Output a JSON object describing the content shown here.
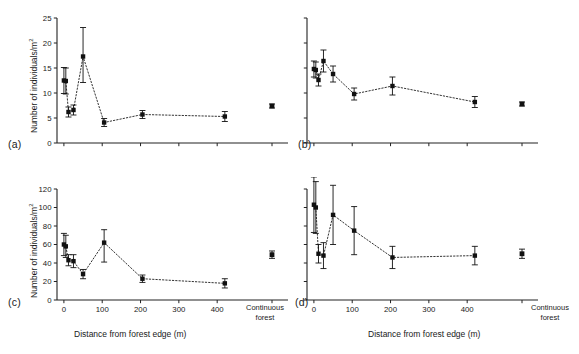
{
  "figure": {
    "panels": [
      "a",
      "b",
      "c",
      "d"
    ],
    "tag_a": "(a)",
    "tag_b": "(b)",
    "tag_c": "(c)",
    "tag_d": "(d)",
    "ylabel_text": "Number of individuals/m",
    "ylabel_sup": "2",
    "xlabel_text": "Distance from forest edge (m)",
    "continuous_label_line1": "Continuous",
    "continuous_label_line2": "forest",
    "marker_color": "#111111",
    "line_color": "#333333",
    "axis_color": "#222222"
  },
  "chart_data": [
    {
      "type": "scatter",
      "panel": "a",
      "title": "(a)",
      "xlabel": "",
      "ylabel": "Number of individuals/m2",
      "xlim": [
        -18,
        470
      ],
      "ylim": [
        0,
        25
      ],
      "yticks": [
        0,
        5,
        10,
        15,
        20,
        25
      ],
      "ytick_labels": [
        "0",
        "5",
        "10",
        "15",
        "20",
        "25"
      ],
      "xticks": [
        0,
        100,
        200,
        300,
        400
      ],
      "xtick_labels": [
        "",
        "",
        "",
        "",
        ""
      ],
      "grid": false,
      "legend": "none",
      "x": [
        0,
        5,
        12,
        25,
        50,
        105,
        205,
        420
      ],
      "y": [
        12.5,
        12.4,
        6.2,
        6.6,
        17.3,
        4.1,
        5.7,
        5.3
      ],
      "yerr_low": [
        2.6,
        2.6,
        1.0,
        1.0,
        5.2,
        0.8,
        0.8,
        1.0
      ],
      "yerr_high": [
        2.6,
        2.6,
        1.0,
        1.0,
        5.8,
        0.8,
        0.8,
        1.0
      ],
      "continuous_forest": {
        "value": 7.4,
        "err_low": 0.4,
        "err_high": 0.4
      },
      "connect_dotted": true
    },
    {
      "type": "scatter",
      "panel": "b",
      "title": "(b)",
      "xlabel": "",
      "ylabel": "",
      "xlim": [
        -18,
        470
      ],
      "ylim": [
        0,
        25
      ],
      "yticks": [
        0,
        5,
        10,
        15,
        20,
        25
      ],
      "ytick_labels": [
        "",
        "",
        "",
        "",
        "",
        ""
      ],
      "xticks": [
        0,
        100,
        200,
        300,
        400
      ],
      "xtick_labels": [
        "",
        "",
        "",
        "",
        ""
      ],
      "grid": false,
      "legend": "none",
      "x": [
        0,
        5,
        12,
        25,
        50,
        105,
        205,
        420
      ],
      "y": [
        14.8,
        14.6,
        12.6,
        16.4,
        13.8,
        9.8,
        11.4,
        8.2
      ],
      "yerr_low": [
        1.6,
        1.6,
        1.2,
        2.2,
        1.6,
        1.2,
        1.8,
        1.1
      ],
      "yerr_high": [
        1.6,
        1.6,
        1.2,
        2.2,
        1.6,
        1.2,
        1.8,
        1.1
      ],
      "continuous_forest": {
        "value": 7.8,
        "err_low": 0.4,
        "err_high": 0.4
      },
      "connect_dotted": true
    },
    {
      "type": "scatter",
      "panel": "c",
      "title": "(c)",
      "xlabel": "Distance from forest edge (m)",
      "ylabel": "Number of individuals/m2",
      "xlim": [
        -18,
        470
      ],
      "ylim": [
        0,
        120
      ],
      "yticks": [
        0,
        20,
        40,
        60,
        80,
        100,
        120
      ],
      "ytick_labels": [
        "0",
        "20",
        "40",
        "60",
        "80",
        "100",
        "120"
      ],
      "xticks": [
        0,
        100,
        200,
        300,
        400
      ],
      "xtick_labels": [
        "0",
        "100",
        "200",
        "300",
        "400"
      ],
      "grid": false,
      "legend": "none",
      "x": [
        0,
        5,
        12,
        25,
        50,
        105,
        205,
        420
      ],
      "y": [
        60,
        58,
        43,
        42,
        28,
        62,
        23,
        18
      ],
      "yerr_low": [
        12,
        12,
        6,
        7,
        5,
        21,
        4,
        5
      ],
      "yerr_high": [
        12,
        12,
        6,
        7,
        5,
        14,
        4,
        5
      ],
      "continuous_forest": {
        "value": 49,
        "err_low": 4,
        "err_high": 4
      },
      "connect_dotted": true
    },
    {
      "type": "scatter",
      "panel": "d",
      "title": "(d)",
      "xlabel": "Distance from forest edge (m)",
      "ylabel": "",
      "xlim": [
        -18,
        470
      ],
      "ylim": [
        0,
        120
      ],
      "yticks": [
        0,
        20,
        40,
        60,
        80,
        100,
        120
      ],
      "ytick_labels": [
        "",
        "",
        "",
        "",
        "",
        "",
        ""
      ],
      "xticks": [
        0,
        100,
        200,
        300,
        400
      ],
      "xtick_labels": [
        "0",
        "100",
        "200",
        "300",
        "400"
      ],
      "grid": false,
      "legend": "none",
      "x": [
        0,
        5,
        12,
        25,
        50,
        105,
        205,
        420
      ],
      "y": [
        103,
        100,
        50,
        48,
        92,
        75,
        46,
        48
      ],
      "yerr_low": [
        30,
        28,
        10,
        14,
        32,
        26,
        12,
        10
      ],
      "yerr_high": [
        30,
        28,
        10,
        14,
        32,
        26,
        12,
        10
      ],
      "continuous_forest": {
        "value": 50,
        "err_low": 5,
        "err_high": 5
      },
      "connect_dotted": true
    }
  ]
}
